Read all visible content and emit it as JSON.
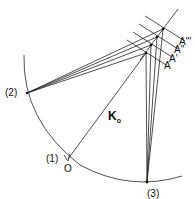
{
  "diagram": {
    "labels": {
      "p2": "(2)",
      "p1": "(1)",
      "origin": "O",
      "p3": "(3)",
      "k": "K",
      "k_sub": "o",
      "a0": "A",
      "a1": "A'",
      "a2": "A\"",
      "a3": "A'''"
    },
    "points": {
      "p2": [
        27,
        93
      ],
      "origin": [
        68,
        161
      ],
      "p3": [
        147,
        182
      ],
      "A": [
        146,
        53
      ],
      "A1": [
        151,
        45
      ],
      "A2": [
        157,
        37
      ],
      "A3": [
        163,
        29
      ]
    },
    "colors": {
      "stroke": "#222222",
      "background": "#ffffff"
    }
  }
}
